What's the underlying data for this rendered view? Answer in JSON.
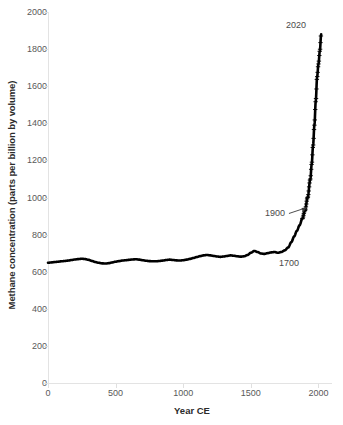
{
  "chart_data": {
    "type": "line",
    "title": "",
    "subtitle": "",
    "xlabel": "Year CE",
    "ylabel": "Methane concentration (parts per billion by volume)",
    "xlim": [
      0,
      2100
    ],
    "ylim": [
      0,
      2000
    ],
    "xticks": [
      0,
      500,
      1000,
      1500,
      2000
    ],
    "xtick_labels": [
      "0",
      "500",
      "1000",
      "1500",
      "2000"
    ],
    "yticks": [
      0,
      200,
      400,
      600,
      800,
      1000,
      1200,
      1400,
      1600,
      1800,
      2000
    ],
    "ytick_labels": [
      "0",
      "200",
      "400",
      "600",
      "800",
      "1000",
      "1200",
      "1400",
      "1600",
      "1800",
      "2000"
    ],
    "grid": false,
    "legend": null,
    "series_color": "#000000",
    "axis_color": "#e3e3e3",
    "marker_style": "dense-dots",
    "annotations": [
      {
        "id": "annot-2020",
        "label": "2020",
        "x": 2020,
        "y": 1880,
        "arrow": false
      },
      {
        "id": "annot-1900",
        "label": "1900",
        "x": 1900,
        "y": 930,
        "arrow": true
      },
      {
        "id": "annot-1700",
        "label": "1700",
        "x": 1700,
        "y": 700,
        "arrow": false
      }
    ],
    "series": [
      {
        "name": "Atmospheric methane",
        "x": [
          0,
          25,
          50,
          75,
          100,
          125,
          150,
          175,
          200,
          225,
          250,
          275,
          300,
          325,
          350,
          375,
          400,
          425,
          450,
          475,
          500,
          525,
          550,
          575,
          600,
          625,
          650,
          675,
          700,
          725,
          750,
          775,
          800,
          825,
          850,
          875,
          900,
          925,
          950,
          975,
          1000,
          1025,
          1050,
          1075,
          1100,
          1125,
          1150,
          1175,
          1200,
          1225,
          1250,
          1275,
          1300,
          1325,
          1350,
          1375,
          1400,
          1425,
          1450,
          1475,
          1500,
          1525,
          1550,
          1575,
          1600,
          1625,
          1650,
          1675,
          1700,
          1725,
          1750,
          1775,
          1800,
          1820,
          1840,
          1860,
          1880,
          1900,
          1920,
          1940,
          1950,
          1960,
          1970,
          1980,
          1990,
          2000,
          2010,
          2020
        ],
        "y": [
          648,
          650,
          652,
          654,
          656,
          658,
          660,
          663,
          666,
          668,
          670,
          668,
          664,
          658,
          652,
          648,
          645,
          644,
          646,
          650,
          654,
          657,
          660,
          662,
          664,
          666,
          667,
          665,
          662,
          659,
          657,
          656,
          656,
          658,
          660,
          663,
          665,
          663,
          661,
          660,
          662,
          665,
          669,
          674,
          679,
          684,
          688,
          690,
          688,
          685,
          682,
          680,
          682,
          685,
          688,
          686,
          683,
          681,
          683,
          690,
          702,
          712,
          706,
          698,
          696,
          700,
          704,
          706,
          702,
          706,
          715,
          730,
          760,
          790,
          820,
          850,
          885,
          930,
          1000,
          1100,
          1180,
          1280,
          1390,
          1520,
          1650,
          1720,
          1790,
          1880
        ]
      }
    ]
  }
}
